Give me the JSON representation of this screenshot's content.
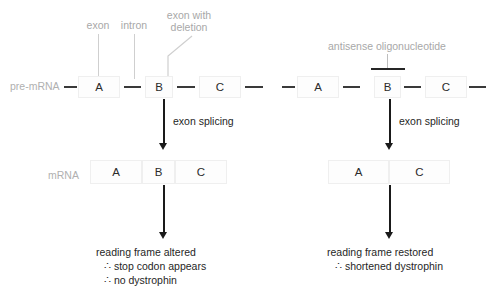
{
  "diagram": {
    "row_labels": {
      "pre_mrna": "pre-mRNA",
      "mrna": "mRNA"
    },
    "callouts": {
      "exon": "exon",
      "intron": "intron",
      "exon_with_deletion_line1": "exon with",
      "exon_with_deletion_line2": "deletion",
      "antisense": "antisense oligonucleotide"
    },
    "process_labels": {
      "splicing_left": "exon splicing",
      "splicing_right": "exon splicing"
    },
    "outcomes": {
      "left": [
        "reading frame altered",
        "∴ stop codon appears",
        "∴ no dystrophin"
      ],
      "right": [
        "reading frame restored",
        "∴ shortened dystrophin"
      ]
    },
    "panels": {
      "left": {
        "name": "untreated-panel",
        "pre_mrna_exons": [
          "A",
          "B",
          "C"
        ],
        "mrna_exons": [
          "A",
          "B",
          "C"
        ]
      },
      "right": {
        "name": "aso-treated-panel",
        "pre_mrna_exons": [
          "A",
          "B",
          "C"
        ],
        "mrna_exons": [
          "A",
          "C"
        ]
      }
    },
    "colors": {
      "text_dark": "#1f1f1f",
      "text_gray": "#a8a8a8",
      "exon_border": "#efefef",
      "intron": "#3a3a3a",
      "arrow": "#1a1a1a",
      "background": "#ffffff"
    }
  }
}
